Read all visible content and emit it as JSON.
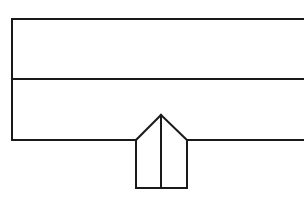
{
  "drawing": {
    "title": "Technical Line Drawing",
    "type": "line-drawing",
    "canvas": {
      "width": 304,
      "height": 199,
      "background_color": "#ffffff"
    },
    "style": {
      "stroke_color": "#1a1a1a",
      "stroke_width": 2,
      "fill_color": "#ffffff",
      "line_cap": "square",
      "line_join": "miter"
    },
    "description": "Elevation-style outline of a horizontal band divided into two stacked rows, with a centered upward-pointing gabled projection below, split by a vertical center line.",
    "geometry": {
      "band": {
        "name": "horizontal-band",
        "left_x": 12,
        "top_y": 19,
        "divider_y": 79,
        "bottom_y": 140,
        "right_x": 304,
        "right_edge_open": true,
        "rows": [
          {
            "name": "upper-row",
            "top_y": 19,
            "bottom_y": 79,
            "height": 60
          },
          {
            "name": "lower-row",
            "top_y": 79,
            "bottom_y": 140,
            "height": 61
          }
        ]
      },
      "projection": {
        "name": "gabled-projection",
        "apex_x": 161,
        "apex_y": 115,
        "shoulder_y": 140,
        "left_x": 136,
        "right_x": 187,
        "bottom_y": 188,
        "width": 51,
        "total_height": 73,
        "center_divider_x": 161,
        "center_divider_top_y": 115,
        "center_divider_bottom_y": 188
      }
    },
    "segments": [
      {
        "name": "band-left-edge",
        "x1": 12,
        "y1": 19,
        "x2": 12,
        "y2": 140
      },
      {
        "name": "band-top-edge",
        "x1": 12,
        "y1": 19,
        "x2": 304,
        "y2": 19
      },
      {
        "name": "band-middle-divider",
        "x1": 12,
        "y1": 79,
        "x2": 304,
        "y2": 79
      },
      {
        "name": "band-bottom-edge-left",
        "x1": 12,
        "y1": 140,
        "x2": 136,
        "y2": 140
      },
      {
        "name": "band-bottom-edge-right",
        "x1": 187,
        "y1": 140,
        "x2": 304,
        "y2": 140
      },
      {
        "name": "gable-left-slope",
        "x1": 136,
        "y1": 140,
        "x2": 161,
        "y2": 115
      },
      {
        "name": "gable-right-slope",
        "x1": 161,
        "y1": 115,
        "x2": 187,
        "y2": 140
      },
      {
        "name": "projection-left-edge",
        "x1": 136,
        "y1": 140,
        "x2": 136,
        "y2": 188
      },
      {
        "name": "projection-right-edge",
        "x1": 187,
        "y1": 140,
        "x2": 187,
        "y2": 188
      },
      {
        "name": "projection-bottom-edge",
        "x1": 136,
        "y1": 188,
        "x2": 187,
        "y2": 188
      },
      {
        "name": "projection-center-divider",
        "x1": 161,
        "y1": 115,
        "x2": 161,
        "y2": 188
      }
    ]
  }
}
